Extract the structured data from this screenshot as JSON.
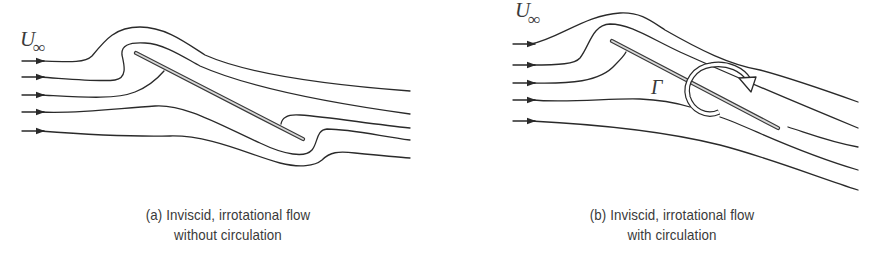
{
  "panels": [
    {
      "id": "a",
      "freestream_label": "U",
      "freestream_subscript": "∞",
      "caption_line1": "(a)  Inviscid, irrotational flow",
      "caption_line2": "without circulation",
      "streamline_count": 5,
      "plate": "inclined flat plate",
      "circulation": false
    },
    {
      "id": "b",
      "freestream_label": "U",
      "freestream_subscript": "∞",
      "circulation_symbol": "Γ",
      "caption_line1": "(b)  Inviscid, irrotational flow",
      "caption_line2": "with circulation",
      "streamline_count": 5,
      "plate": "inclined flat plate",
      "circulation": true
    }
  ],
  "colors": {
    "line": "#2a2a2a",
    "text": "#3a3a3a",
    "background": "#ffffff"
  }
}
